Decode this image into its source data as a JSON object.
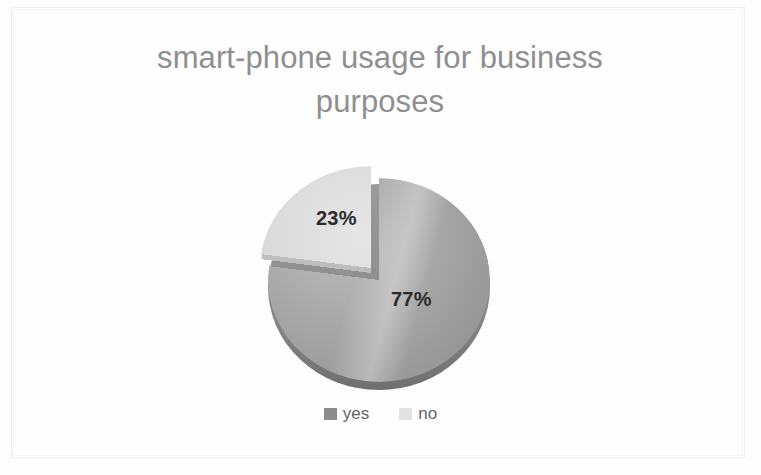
{
  "chart_data": {
    "type": "pie",
    "title": "smart-phone usage for business\npurposes",
    "categories": [
      "yes",
      "no"
    ],
    "values": [
      77,
      23
    ],
    "data_labels": [
      "77%",
      "23%"
    ],
    "units": "percent",
    "legend_position": "bottom",
    "grid": false,
    "exploded_slice": "no",
    "three_d": true,
    "series": [
      {
        "name": "smart-phone usage for business purposes",
        "points": [
          {
            "label": "yes",
            "value": 77,
            "display": "77%",
            "color": "#a3a3a3"
          },
          {
            "label": "no",
            "value": 23,
            "display": "23%",
            "color": "#dcdcdc"
          }
        ]
      }
    ]
  },
  "title": {
    "text": "smart-phone usage for business\npurposes",
    "color": "#8f8f8f"
  },
  "pie": {
    "yes_percent_label": "77%",
    "no_percent_label": "23%",
    "yes_color": "#a3a3a3",
    "no_color": "#dcdcdc"
  },
  "legend": {
    "items": [
      {
        "label": "yes",
        "color": "#8c8c8c"
      },
      {
        "label": "no",
        "color": "#e0e0e0"
      }
    ]
  }
}
